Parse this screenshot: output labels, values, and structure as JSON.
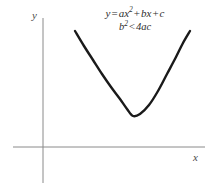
{
  "figure": {
    "background_color": "#ffffff"
  },
  "equation": {
    "line1": {
      "lhs": "y",
      "equals": "=",
      "term1_coeff": "ax",
      "term1_exponent": "2",
      "plus1": "+",
      "term2": "bx",
      "plus2": "+",
      "term3": "c",
      "full_text": "y = ax2 + bx + c"
    },
    "line2": {
      "lhs": "b",
      "lhs_exponent": "2",
      "relation": "<",
      "rhs": "4ac",
      "full_text": "b2 < 4ac"
    }
  },
  "axes": {
    "x_label": "x",
    "y_label": "y",
    "color": "#8a8a8a",
    "stroke_width": 1,
    "origin": {
      "x": 43,
      "y": 147
    },
    "x_axis": {
      "x_start": 13,
      "x_end": 205,
      "y": 147
    },
    "y_axis": {
      "x": 43,
      "y_start": 18,
      "y_end": 183
    },
    "ticks": "none",
    "grid": "off"
  },
  "chart_data": {
    "type": "line",
    "title": "",
    "xlabel": "x",
    "ylabel": "y",
    "grid": false,
    "legend": null,
    "curve": {
      "name": "y = ax^2 + bx + c",
      "color": "#1a1a1a",
      "stroke_width": 2.4,
      "description": "upward-opening parabola entirely above the x-axis (no real roots, b^2 < 4ac)",
      "vertex_px": {
        "x": 133,
        "y": 116
      },
      "left_end_px": {
        "x": 75,
        "y": 31
      },
      "right_end_px": {
        "x": 190,
        "y": 31
      },
      "points_px": [
        {
          "x": 75,
          "y": 31
        },
        {
          "x": 84,
          "y": 46
        },
        {
          "x": 93,
          "y": 60
        },
        {
          "x": 102,
          "y": 74
        },
        {
          "x": 111,
          "y": 87
        },
        {
          "x": 120,
          "y": 99
        },
        {
          "x": 127,
          "y": 109
        },
        {
          "x": 133,
          "y": 116
        },
        {
          "x": 140,
          "y": 114
        },
        {
          "x": 149,
          "y": 105
        },
        {
          "x": 158,
          "y": 91
        },
        {
          "x": 167,
          "y": 74
        },
        {
          "x": 176,
          "y": 57
        },
        {
          "x": 183,
          "y": 43
        },
        {
          "x": 190,
          "y": 31
        }
      ]
    }
  }
}
